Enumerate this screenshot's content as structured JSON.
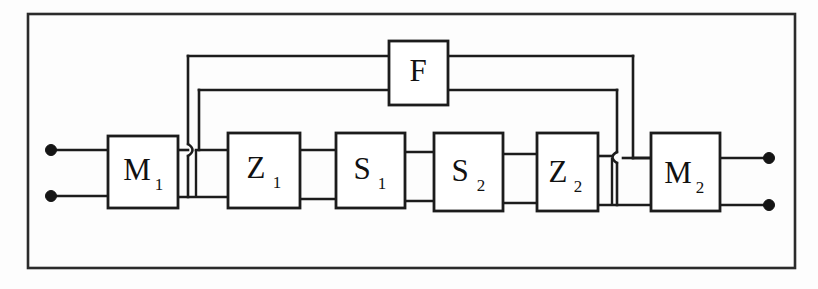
{
  "figure": {
    "type": "block-diagram",
    "title": "",
    "background_color": "#fdfdfd",
    "line_color": "#1c1c1c",
    "frame": {
      "x": 28,
      "y": 14,
      "width": 767,
      "height": 254
    }
  },
  "blocks": [
    {
      "id": "M1",
      "label": "M",
      "subscript": "1",
      "x": 108,
      "y": 136,
      "width": 70,
      "height": 72
    },
    {
      "id": "Z1",
      "label": "Z",
      "subscript": "1",
      "x": 228,
      "y": 133,
      "width": 72,
      "height": 75
    },
    {
      "id": "S1",
      "label": "S",
      "subscript": "1",
      "x": 336,
      "y": 133,
      "width": 69,
      "height": 75
    },
    {
      "id": "S2",
      "label": "S",
      "subscript": "2",
      "x": 434,
      "y": 133,
      "width": 69,
      "height": 78
    },
    {
      "id": "Z2",
      "label": "Z",
      "subscript": "2",
      "x": 537,
      "y": 133,
      "width": 61,
      "height": 78
    },
    {
      "id": "M2",
      "label": "M",
      "subscript": "2",
      "x": 651,
      "y": 133,
      "width": 69,
      "height": 78
    },
    {
      "id": "F",
      "label": "F",
      "subscript": "",
      "x": 389,
      "y": 41,
      "width": 59,
      "height": 64
    }
  ],
  "terminals": [
    {
      "id": "in-top",
      "x": 51,
      "y": 150,
      "r": 5
    },
    {
      "id": "in-bottom",
      "x": 51,
      "y": 196,
      "r": 5
    },
    {
      "id": "out-top",
      "x": 769,
      "y": 158,
      "r": 5
    },
    {
      "id": "out-bottom",
      "x": 769,
      "y": 205,
      "r": 5
    }
  ],
  "signal_path": {
    "top_rail_y": 150,
    "bottom_rail_y": 196,
    "order": [
      "M1",
      "Z1",
      "S1",
      "S2",
      "Z2",
      "M2"
    ],
    "description": "Two-wire cascade from input terminals through M1, Z1, S1, S2, Z2 to M2 and output terminals."
  },
  "feedback": {
    "outer": {
      "left_x": 188,
      "right_x": 633,
      "y": 56,
      "from": "F",
      "description": "Outer feedback loop from F output down to the bottom rail near M1 input, with a wire hop crossing the top rail."
    },
    "inner": {
      "left_x": 199,
      "right_x": 617,
      "y": 90,
      "from": "F",
      "description": "Inner feedback loop from F output to the top rail near Z1 input."
    },
    "hops": [
      {
        "id": "hop-left",
        "x": 188,
        "y": 150
      },
      {
        "id": "hop-right",
        "x": 617,
        "y": 158
      }
    ]
  },
  "legend": {
    "block_meanings": [
      {
        "symbol": "M",
        "note": ""
      },
      {
        "symbol": "Z",
        "note": ""
      },
      {
        "symbol": "S",
        "note": ""
      },
      {
        "symbol": "F",
        "note": ""
      }
    ]
  }
}
